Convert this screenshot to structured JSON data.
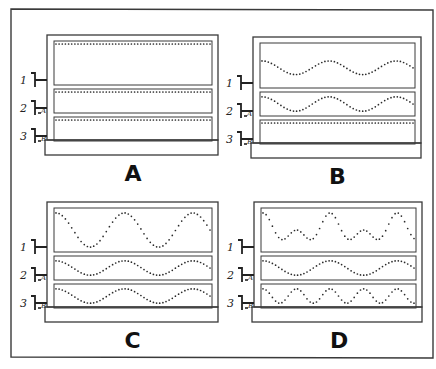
{
  "figure": {
    "stroke_color": "#3a3a3a",
    "dot_color": "#2a2a2a",
    "background": "#ffffff",
    "panels": [
      {
        "id": "A",
        "label": "A",
        "x": 47,
        "y": 35,
        "w": 171,
        "h": 105,
        "channels": [
          {
            "index": "1",
            "type": "flat",
            "cycles": 0,
            "amplitude": 0
          },
          {
            "index": "2",
            "type": "flat",
            "cycles": 0,
            "amplitude": 0,
            "tag": "A"
          },
          {
            "index": "3",
            "type": "flat",
            "cycles": 0,
            "amplitude": 0,
            "tag": "B"
          }
        ]
      },
      {
        "id": "B",
        "label": "B",
        "x": 253,
        "y": 37,
        "w": 168,
        "h": 106,
        "channels": [
          {
            "index": "1",
            "type": "sine",
            "cycles": 2.25,
            "amplitude": 0.35
          },
          {
            "index": "2",
            "type": "sine",
            "cycles": 2.25,
            "amplitude": 0.8,
            "tag": "A"
          },
          {
            "index": "3",
            "type": "flat",
            "cycles": 0,
            "amplitude": 0,
            "tag": "B"
          }
        ]
      },
      {
        "id": "C",
        "label": "C",
        "x": 47,
        "y": 202,
        "w": 171,
        "h": 105,
        "channels": [
          {
            "index": "1",
            "type": "sine",
            "cycles": 2.25,
            "amplitude": 0.9
          },
          {
            "index": "2",
            "type": "sine",
            "cycles": 2.25,
            "amplitude": 0.8,
            "tag": "A"
          },
          {
            "index": "3",
            "type": "sine",
            "cycles": 2.25,
            "amplitude": 0.8,
            "tag": "B"
          }
        ]
      },
      {
        "id": "D",
        "label": "D",
        "x": 254,
        "y": 202,
        "w": 168,
        "h": 105,
        "channels": [
          {
            "index": "1",
            "type": "sum",
            "cycles": 2.25,
            "amplitude": 0.9
          },
          {
            "index": "2",
            "type": "sine",
            "cycles": 2.25,
            "amplitude": 0.8,
            "tag": "A"
          },
          {
            "index": "3",
            "type": "sine",
            "cycles": 4.5,
            "amplitude": 0.8,
            "tag": "B"
          }
        ]
      }
    ]
  }
}
